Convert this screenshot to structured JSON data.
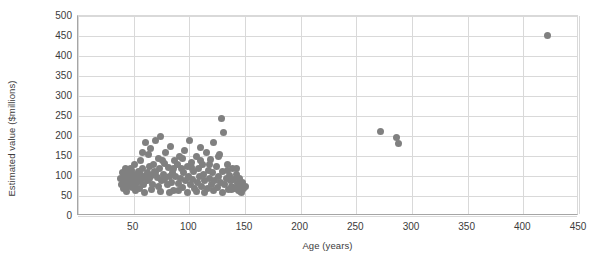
{
  "chart_data": {
    "type": "scatter",
    "title": "",
    "xlabel": "Age (years)",
    "ylabel": "Estimated value ($millions)",
    "xlim": [
      0,
      450
    ],
    "ylim": [
      0,
      500
    ],
    "xticks": [
      0,
      50,
      100,
      150,
      200,
      250,
      300,
      350,
      400,
      450
    ],
    "xtick_labels": [
      "",
      "50",
      "100",
      "150",
      "200",
      "250",
      "300",
      "350",
      "400",
      "450"
    ],
    "yticks": [
      0,
      50,
      100,
      150,
      200,
      250,
      300,
      350,
      400,
      450,
      500
    ],
    "ytick_labels": [
      "0",
      "50",
      "100",
      "150",
      "200",
      "250",
      "300",
      "350",
      "400",
      "450",
      "500"
    ],
    "grid": {
      "horizontal": true,
      "vertical": true
    },
    "legend": null,
    "marker": {
      "shape": "circle",
      "color": "#808080",
      "size": 7
    },
    "points": [
      [
        38,
        95
      ],
      [
        39,
        78
      ],
      [
        40,
        110
      ],
      [
        41,
        88
      ],
      [
        41,
        70
      ],
      [
        42,
        101
      ],
      [
        43,
        120
      ],
      [
        43,
        82
      ],
      [
        44,
        96
      ],
      [
        45,
        108
      ],
      [
        45,
        75
      ],
      [
        46,
        92
      ],
      [
        47,
        118
      ],
      [
        48,
        85
      ],
      [
        48,
        100
      ],
      [
        49,
        72
      ],
      [
        50,
        105
      ],
      [
        50,
        90
      ],
      [
        51,
        128
      ],
      [
        52,
        80
      ],
      [
        53,
        97
      ],
      [
        54,
        112
      ],
      [
        55,
        86
      ],
      [
        55,
        68
      ],
      [
        56,
        103
      ],
      [
        57,
        93
      ],
      [
        58,
        160
      ],
      [
        58,
        120
      ],
      [
        59,
        78
      ],
      [
        60,
        99
      ],
      [
        61,
        185
      ],
      [
        62,
        108
      ],
      [
        62,
        88
      ],
      [
        63,
        155
      ],
      [
        64,
        95
      ],
      [
        65,
        170
      ],
      [
        66,
        102
      ],
      [
        67,
        80
      ],
      [
        68,
        130
      ],
      [
        69,
        112
      ],
      [
        70,
        190
      ],
      [
        71,
        96
      ],
      [
        72,
        145
      ],
      [
        72,
        75
      ],
      [
        73,
        118
      ],
      [
        74,
        200
      ],
      [
        75,
        88
      ],
      [
        76,
        138
      ],
      [
        77,
        105
      ],
      [
        78,
        92
      ],
      [
        79,
        160
      ],
      [
        80,
        78
      ],
      [
        81,
        122
      ],
      [
        82,
        98
      ],
      [
        83,
        175
      ],
      [
        84,
        85
      ],
      [
        85,
        110
      ],
      [
        86,
        65
      ],
      [
        87,
        140
      ],
      [
        88,
        100
      ],
      [
        89,
        128
      ],
      [
        90,
        82
      ],
      [
        91,
        150
      ],
      [
        92,
        95
      ],
      [
        93,
        118
      ],
      [
        94,
        72
      ],
      [
        95,
        108
      ],
      [
        96,
        165
      ],
      [
        97,
        88
      ],
      [
        98,
        125
      ],
      [
        99,
        100
      ],
      [
        100,
        190
      ],
      [
        101,
        78
      ],
      [
        102,
        135
      ],
      [
        103,
        92
      ],
      [
        104,
        112
      ],
      [
        105,
        68
      ],
      [
        106,
        148
      ],
      [
        107,
        85
      ],
      [
        108,
        120
      ],
      [
        109,
        98
      ],
      [
        110,
        172
      ],
      [
        111,
        75
      ],
      [
        112,
        130
      ],
      [
        113,
        105
      ],
      [
        114,
        88
      ],
      [
        115,
        158
      ],
      [
        116,
        70
      ],
      [
        117,
        115
      ],
      [
        118,
        95
      ],
      [
        119,
        142
      ],
      [
        120,
        80
      ],
      [
        121,
        108
      ],
      [
        122,
        185
      ],
      [
        123,
        90
      ],
      [
        124,
        125
      ],
      [
        125,
        72
      ],
      [
        126,
        100
      ],
      [
        127,
        155
      ],
      [
        128,
        85
      ],
      [
        129,
        245
      ],
      [
        130,
        112
      ],
      [
        131,
        210
      ],
      [
        132,
        78
      ],
      [
        133,
        95
      ],
      [
        134,
        130
      ],
      [
        135,
        66
      ],
      [
        136,
        102
      ],
      [
        137,
        88
      ],
      [
        138,
        75
      ],
      [
        139,
        118
      ],
      [
        140,
        92
      ],
      [
        141,
        70
      ],
      [
        142,
        105
      ],
      [
        143,
        82
      ],
      [
        144,
        64
      ],
      [
        145,
        95
      ],
      [
        146,
        72
      ],
      [
        147,
        60
      ],
      [
        148,
        85
      ],
      [
        149,
        68
      ],
      [
        150,
        75
      ],
      [
        44,
        62
      ],
      [
        52,
        64
      ],
      [
        60,
        60
      ],
      [
        66,
        66
      ],
      [
        74,
        62
      ],
      [
        82,
        58
      ],
      [
        90,
        64
      ],
      [
        98,
        60
      ],
      [
        106,
        62
      ],
      [
        114,
        58
      ],
      [
        122,
        64
      ],
      [
        130,
        60
      ],
      [
        138,
        66
      ],
      [
        146,
        62
      ],
      [
        48,
        115
      ],
      [
        56,
        140
      ],
      [
        64,
        125
      ],
      [
        70,
        108
      ],
      [
        78,
        132
      ],
      [
        86,
        118
      ],
      [
        94,
        145
      ],
      [
        102,
        122
      ],
      [
        110,
        138
      ],
      [
        118,
        128
      ],
      [
        126,
        148
      ],
      [
        134,
        115
      ],
      [
        142,
        120
      ],
      [
        272,
        212
      ],
      [
        286,
        196
      ],
      [
        288,
        182
      ],
      [
        422,
        452
      ]
    ]
  }
}
